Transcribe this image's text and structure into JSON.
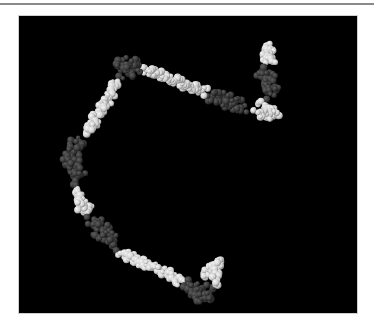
{
  "figure": {
    "background_color": "#000000",
    "colors": {
      "light_segment": "#d8d8d8",
      "light_highlight": "#f4f4f4",
      "dark_segment": "#3a3a3a",
      "dark_highlight": "#5a5a5a"
    },
    "segments": [
      {
        "tone": "light",
        "points": [
          [
            268,
            46
          ],
          [
            270,
            52
          ],
          [
            266,
            58
          ],
          [
            272,
            62
          ]
        ]
      },
      {
        "tone": "dark",
        "points": [
          [
            262,
            70
          ],
          [
            268,
            78
          ],
          [
            272,
            86
          ],
          [
            268,
            94
          ]
        ]
      },
      {
        "tone": "light",
        "points": [
          [
            262,
            104
          ],
          [
            270,
            110
          ],
          [
            276,
            114
          ],
          [
            266,
            116
          ],
          [
            256,
            112
          ]
        ]
      },
      {
        "tone": "dark",
        "points": [
          [
            244,
            106
          ],
          [
            232,
            104
          ],
          [
            222,
            100
          ],
          [
            212,
            96
          ]
        ]
      },
      {
        "tone": "light",
        "points": [
          [
            204,
            92
          ],
          [
            194,
            88
          ],
          [
            184,
            84
          ],
          [
            174,
            80
          ],
          [
            164,
            76
          ],
          [
            154,
            72
          ],
          [
            146,
            70
          ]
        ]
      },
      {
        "tone": "dark",
        "points": [
          [
            138,
            66
          ],
          [
            128,
            62
          ],
          [
            122,
            70
          ],
          [
            130,
            74
          ]
        ]
      },
      {
        "tone": "light",
        "points": [
          [
            116,
            82
          ],
          [
            112,
            92
          ],
          [
            106,
            102
          ],
          [
            100,
            112
          ],
          [
            94,
            122
          ],
          [
            88,
            132
          ]
        ]
      },
      {
        "tone": "dark",
        "points": [
          [
            80,
            140
          ],
          [
            74,
            150
          ],
          [
            70,
            162
          ],
          [
            76,
            170
          ],
          [
            80,
            180
          ]
        ]
      },
      {
        "tone": "light",
        "points": [
          [
            76,
            192
          ],
          [
            82,
            202
          ],
          [
            88,
            210
          ],
          [
            80,
            206
          ]
        ]
      },
      {
        "tone": "dark",
        "points": [
          [
            92,
            220
          ],
          [
            100,
            228
          ],
          [
            108,
            236
          ],
          [
            114,
            244
          ]
        ]
      },
      {
        "tone": "light",
        "points": [
          [
            122,
            252
          ],
          [
            132,
            258
          ],
          [
            142,
            262
          ],
          [
            152,
            266
          ],
          [
            162,
            270
          ],
          [
            172,
            276
          ],
          [
            180,
            282
          ]
        ]
      },
      {
        "tone": "dark",
        "points": [
          [
            188,
            286
          ],
          [
            196,
            292
          ],
          [
            204,
            296
          ],
          [
            210,
            290
          ]
        ]
      },
      {
        "tone": "light",
        "points": [
          [
            206,
            276
          ],
          [
            212,
            268
          ],
          [
            220,
            262
          ],
          [
            214,
            282
          ]
        ]
      }
    ]
  }
}
